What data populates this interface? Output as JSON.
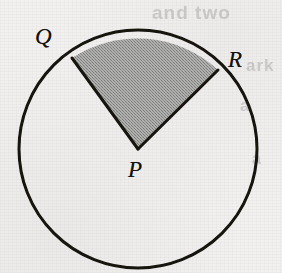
{
  "figure": {
    "name": "circle-with-shaded-sector",
    "caption": "",
    "background_color": "#f2f1ef",
    "stroke_color": "#141210",
    "shaded_fill_color": "#9a9a9a",
    "circle": {
      "center_label": "P",
      "center_x": 138,
      "center_y": 149,
      "radius": 119,
      "stroke_width": 3
    },
    "sector": {
      "shaded": true,
      "apex_label": "P",
      "arc_start_label": "Q",
      "arc_end_label": "R",
      "start_point_x": 72,
      "start_point_y": 58,
      "end_point_x": 218,
      "end_point_y": 70,
      "start_angle_degrees": 135,
      "end_angle_degrees": 48,
      "central_angle_degrees": 87
    },
    "labels": {
      "q": "Q",
      "r": "R",
      "p": "P"
    }
  },
  "bleed_through_text": {
    "line_1": "and two",
    "line_2": "ark",
    "line_3": "a",
    "line_4": "a"
  }
}
